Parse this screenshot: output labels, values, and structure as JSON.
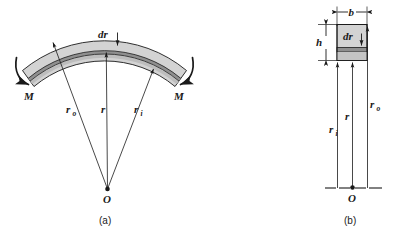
{
  "figure": {
    "panels": [
      {
        "id": "a",
        "caption": "(a)",
        "name": "curved-beam-side-view",
        "labels": {
          "moment_left": "M",
          "moment_right": "M",
          "element_thickness": "dr",
          "radius_outer": "r",
          "radius_outer_sub": "o",
          "radius_centroid": "r",
          "radius_inner": "r",
          "radius_inner_sub": "i",
          "origin": "O"
        }
      },
      {
        "id": "b",
        "caption": "(b)",
        "name": "cross-section-view",
        "labels": {
          "width": "b",
          "height": "h",
          "element_thickness": "dr",
          "radius_inner": "r",
          "radius_inner_sub": "i",
          "radius_centroid": "r",
          "radius_outer": "r",
          "radius_outer_sub": "o",
          "origin": "O"
        }
      }
    ],
    "colors": {
      "body_fill": "#d3d3d3",
      "element_fill": "#9a9a9a",
      "inner_strip_fill": "#c0c0c0",
      "line": "#1a1a1a",
      "background": "#ffffff"
    }
  }
}
